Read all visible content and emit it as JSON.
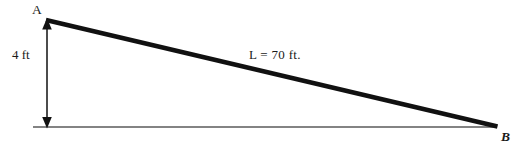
{
  "diagram": {
    "type": "right-triangle-ramp",
    "background_color": "#ffffff",
    "stroke_color": "#111111",
    "baseline_color": "#555555",
    "vertices": {
      "a": {
        "label": "A",
        "x": 46,
        "y": 20,
        "description": "top of vertical rise"
      },
      "b": {
        "label": "B",
        "x": 497,
        "y": 127,
        "description": "bottom right, ground level"
      },
      "base_left": {
        "x": 33,
        "y": 127,
        "description": "left end of ground line"
      }
    },
    "labels": {
      "point_a": "A",
      "point_b": "B",
      "height": "4 ft",
      "length": "L = 70 ft."
    },
    "measurements": {
      "height_value": 4,
      "height_unit": "ft",
      "length_symbol": "L",
      "length_value": 70,
      "length_unit": "ft"
    },
    "elements": {
      "hypotenuse_name": "ramp-line",
      "baseline_name": "ground-line",
      "dimension_name": "height-dimension-arrow"
    }
  }
}
